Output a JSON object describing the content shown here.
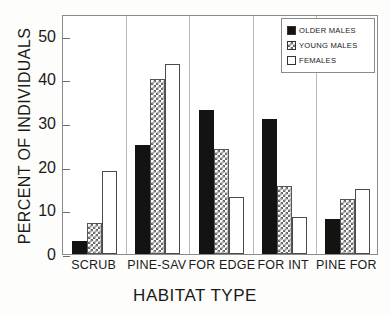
{
  "chart_data": {
    "type": "bar",
    "title": "",
    "xlabel": "HABITAT  TYPE",
    "ylabel": "PERCENT  OF  INDIVIDUALS",
    "categories": [
      "SCRUB",
      "PINE-SAV",
      "FOR EDGE",
      "FOR INT",
      "PINE FOR"
    ],
    "series": [
      {
        "name": "OLDER  MALES",
        "values": [
          3,
          25,
          33,
          31,
          8
        ],
        "fill": "solid-black",
        "color": "#151311"
      },
      {
        "name": "YOUNG  MALES",
        "values": [
          7,
          40,
          24,
          15.5,
          12.5
        ],
        "fill": "checkerboard",
        "color": "#666666"
      },
      {
        "name": "FEMALES",
        "values": [
          19,
          43.5,
          13,
          8.5,
          15
        ],
        "fill": "white",
        "color": "#ffffff"
      }
    ],
    "ylim": [
      0,
      55
    ],
    "yticks": [
      0,
      10,
      20,
      30,
      40,
      50
    ],
    "ytick_labels": [
      "0",
      "10",
      "20",
      "30",
      "40",
      "50"
    ],
    "grid": false,
    "legend_position": "top-right",
    "axis_color": "#8a8a8a"
  },
  "legend": {
    "items": [
      {
        "label": "OLDER  MALES",
        "swatch": "solid-black-swatch"
      },
      {
        "label": "YOUNG  MALES",
        "swatch": "checkerboard-swatch"
      },
      {
        "label": "FEMALES",
        "swatch": "white-swatch"
      }
    ]
  }
}
